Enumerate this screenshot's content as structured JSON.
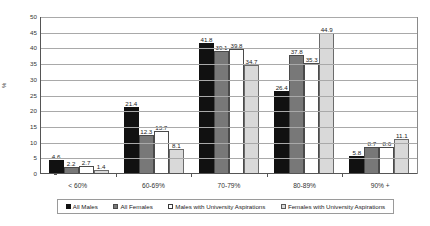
{
  "chart_data": {
    "type": "bar",
    "title": "",
    "subtitle": "",
    "xlabel": "",
    "ylabel": "%",
    "ylim": [
      0,
      50
    ],
    "ytick_step": 5,
    "yticks": [
      "0",
      "5",
      "10",
      "15",
      "20",
      "25",
      "30",
      "35",
      "40",
      "45",
      "50"
    ],
    "grid": true,
    "legend_position": "bottom",
    "categories": [
      "< 60%",
      "60-69%",
      "70-79%",
      "80-89%",
      "90% +"
    ],
    "series": [
      {
        "name": "All Males",
        "color": "#111111",
        "values": [
          4.6,
          21.4,
          41.8,
          26.4,
          5.8
        ],
        "labels": [
          "4.6",
          "21.4",
          "41.8",
          "26.4",
          "5.8"
        ]
      },
      {
        "name": "All Females",
        "color": "#787878",
        "values": [
          2.2,
          12.3,
          39.1,
          37.8,
          8.7
        ],
        "labels": [
          "2.2",
          "12.3",
          "39.1",
          "37.8",
          "8.7"
        ]
      },
      {
        "name": "Males with University Aspirations",
        "color": "#ffffff",
        "values": [
          2.7,
          13.7,
          39.8,
          35.3,
          8.6
        ],
        "labels": [
          "2.7",
          "13.7",
          "39.8",
          "35.3",
          "8.6"
        ]
      },
      {
        "name": "Females with University Aspirations",
        "color": "#d9d9d9",
        "values": [
          1.4,
          8.1,
          34.7,
          44.9,
          11.1
        ],
        "labels": [
          "1.4",
          "8.1",
          "34.7",
          "44.9",
          "11.1"
        ]
      }
    ]
  }
}
